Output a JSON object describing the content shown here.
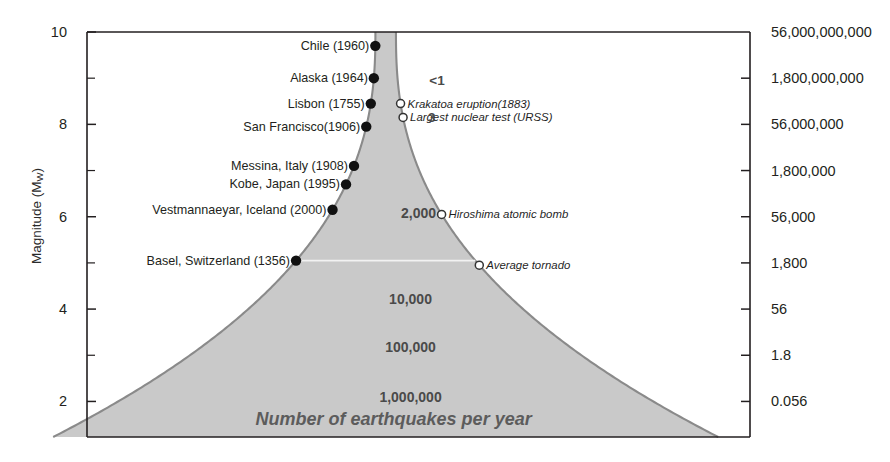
{
  "chart_data": {
    "type": "area",
    "title": "",
    "caption": "Number of earthquakes per year",
    "ylabel_left_main": "Magnitude (M",
    "ylabel_left_sub": "W",
    "ylabel_left_close": ")",
    "ylabel_right": "Energy in tons of TNT",
    "xlabel": "",
    "ylim": [
      1.2,
      10
    ],
    "grid": false,
    "legend": "none",
    "y_axis_left": {
      "label": "Magnitude (Mw)",
      "major_ticks": [
        10,
        8,
        6,
        4,
        2
      ],
      "major_tick_labels": [
        "10",
        "8",
        "6",
        "4",
        "2"
      ],
      "minor_ticks": [
        9,
        7,
        5,
        3
      ]
    },
    "y_axis_right": {
      "label": "Energy in tons of TNT",
      "ticks": [
        10,
        9,
        8,
        7,
        6,
        5,
        4,
        3,
        2
      ],
      "tick_labels": [
        "56,000,000,000",
        "1,800,000,000",
        "56,000,000",
        "1,800,000",
        "56,000",
        "1,800",
        "56",
        "1.8",
        "0.056"
      ]
    },
    "frequency_labels": [
      {
        "text": "<1",
        "magnitude": 8.95,
        "x_frac": 0.528
      },
      {
        "text": "3",
        "magnitude": 8.15,
        "x_frac": 0.52
      },
      {
        "text": "2,000",
        "magnitude": 6.08,
        "x_frac": 0.5
      },
      {
        "text": "10,000",
        "magnitude": 4.22,
        "x_frac": 0.488
      },
      {
        "text": "100,000",
        "magnitude": 3.17,
        "x_frac": 0.488
      },
      {
        "text": "1,000,000",
        "magnitude": 2.1,
        "x_frac": 0.488
      }
    ],
    "earthquakes": [
      {
        "name": "Chile (1960)",
        "magnitude": 9.7
      },
      {
        "name": "Alaska (1964)",
        "magnitude": 9.0
      },
      {
        "name": "Lisbon (1755)",
        "magnitude": 8.45
      },
      {
        "name": "San Francisco(1906)",
        "magnitude": 7.95
      },
      {
        "name": "Messina, Italy (1908)",
        "magnitude": 7.1
      },
      {
        "name": "Kobe, Japan (1995)",
        "magnitude": 6.7
      },
      {
        "name": "Vestmannaeyar, Iceland (2000)",
        "magnitude": 6.15
      },
      {
        "name": "Basel, Switzerland (1356)",
        "magnitude": 5.05
      }
    ],
    "energy_events": [
      {
        "name": "Krakatoa eruption(1883)",
        "magnitude": 8.45
      },
      {
        "name": "Largest nuclear test (URSS)",
        "magnitude": 8.15
      },
      {
        "name": "Hiroshima atomic bomb",
        "magnitude": 6.05
      },
      {
        "name": "Average tornado",
        "magnitude": 4.95
      }
    ],
    "colors": {
      "funnel_fill": "#c9c9c9",
      "funnel_stroke": "#8a8a8a",
      "axis": "#231f20",
      "text": "#231f20",
      "caption_text": "#5c5c5c",
      "count_text": "#4a4a4a",
      "quake_dot": "#111111",
      "energy_marker_stroke": "#333333",
      "divider_line": "#f2f2f2"
    }
  }
}
